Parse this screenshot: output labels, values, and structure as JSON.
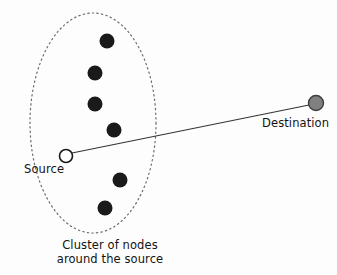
{
  "figure": {
    "type": "network-diagram",
    "background_color": "#fdfdfd",
    "width": 337,
    "height": 275,
    "labels": {
      "source": "Source",
      "destination": "Destination",
      "cluster_caption_line1": "Cluster of nodes",
      "cluster_caption_line2": "around the source"
    },
    "colors": {
      "cluster_node_fill": "#1a1a1a",
      "source_fill": "#ffffff",
      "source_stroke": "#1a1a1a",
      "destination_fill": "#808080",
      "destination_stroke": "#3d3d3d",
      "link_stroke": "#333333",
      "ellipse_stroke": "#6b6b6b",
      "text_color": "#141414"
    },
    "cluster_boundary": {
      "shape": "ellipse",
      "cx": 93,
      "cy": 123,
      "rx": 63,
      "ry": 110,
      "stroke_style": "dotted",
      "stroke_width": 1.2
    },
    "cluster_nodes": [
      {
        "id": "node-1",
        "cx": 107,
        "cy": 41,
        "r": 7.5
      },
      {
        "id": "node-2",
        "cx": 95,
        "cy": 73,
        "r": 7.5
      },
      {
        "id": "node-3",
        "cx": 95,
        "cy": 104,
        "r": 7.5
      },
      {
        "id": "node-4",
        "cx": 114,
        "cy": 130,
        "r": 7.5
      },
      {
        "id": "node-5",
        "cx": 120,
        "cy": 180,
        "r": 7.5
      },
      {
        "id": "node-6",
        "cx": 105,
        "cy": 208,
        "r": 7.5
      }
    ],
    "source_node": {
      "cx": 66,
      "cy": 156,
      "r": 6.5
    },
    "destination_node": {
      "cx": 316,
      "cy": 103,
      "r": 7.5
    },
    "link": {
      "x1": 72,
      "y1": 153,
      "x2": 309,
      "y2": 105,
      "stroke_width": 1.1
    }
  }
}
